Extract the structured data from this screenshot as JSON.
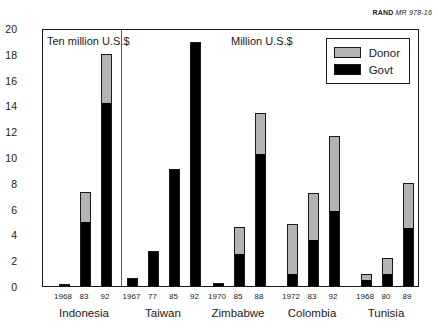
{
  "attribution": {
    "org": "RAND",
    "document_id": "MR 978-16"
  },
  "legend": {
    "items": [
      {
        "label": "Donor",
        "color": "#b3b3b3"
      },
      {
        "label": "Govt",
        "color": "#000000"
      }
    ]
  },
  "annotations": [
    {
      "text": "Ten million U.S.$",
      "applies_to": "Indonesia"
    },
    {
      "text": "Million U.S.$",
      "applies_to": "Taiwan, Zimbabwe, Colombia, Tunisia"
    }
  ],
  "chart_data": {
    "type": "bar",
    "title": "",
    "subtitle": "",
    "xlabel": "",
    "ylabel": "",
    "ylim": [
      0,
      20
    ],
    "yticks": [
      0,
      2,
      4,
      6,
      8,
      10,
      12,
      14,
      16,
      18,
      20
    ],
    "ytick_labels": [
      "0",
      "2",
      "4",
      "6",
      "8",
      "10",
      "12",
      "14",
      "16",
      "18",
      "20"
    ],
    "grid": false,
    "stacked": true,
    "legend_position": "top-right",
    "series": [
      {
        "name": "Govt",
        "color": "#000000"
      },
      {
        "name": "Donor",
        "color": "#b3b3b3"
      }
    ],
    "groups": [
      {
        "country": "Indonesia",
        "units": "Ten million U.S.$",
        "bars": [
          {
            "year": "1968",
            "govt": 0.1,
            "donor": 0.05,
            "total": 0.15
          },
          {
            "year": "83",
            "govt": 5.0,
            "donor": 2.3,
            "total": 7.3
          },
          {
            "year": "92",
            "govt": 14.2,
            "donor": 3.8,
            "total": 18.0
          }
        ]
      },
      {
        "country": "Taiwan",
        "units": "Million U.S.$",
        "bars": [
          {
            "year": "1967",
            "govt": 0.6,
            "donor": 0.0,
            "total": 0.6
          },
          {
            "year": "77",
            "govt": 2.7,
            "donor": 0.0,
            "total": 2.7
          },
          {
            "year": "85",
            "govt": 9.1,
            "donor": 0.0,
            "total": 9.1
          },
          {
            "year": "92",
            "govt": 18.9,
            "donor": 0.0,
            "total": 18.9
          }
        ]
      },
      {
        "country": "Zimbabwe",
        "units": "Million U.S.$",
        "bars": [
          {
            "year": "1970",
            "govt": 0.2,
            "donor": 0.0,
            "total": 0.2
          },
          {
            "year": "85",
            "govt": 2.5,
            "donor": 2.1,
            "total": 4.6
          },
          {
            "year": "88",
            "govt": 10.2,
            "donor": 3.2,
            "total": 13.4
          }
        ]
      },
      {
        "country": "Colombia",
        "units": "Million U.S.$",
        "bars": [
          {
            "year": "1972",
            "govt": 0.9,
            "donor": 3.9,
            "total": 4.8
          },
          {
            "year": "83",
            "govt": 3.6,
            "donor": 3.6,
            "total": 7.2
          },
          {
            "year": "92",
            "govt": 5.8,
            "donor": 5.8,
            "total": 11.6
          }
        ]
      },
      {
        "country": "Tunisia",
        "units": "Million U.S.$",
        "bars": [
          {
            "year": "1968",
            "govt": 0.5,
            "donor": 0.4,
            "total": 0.9
          },
          {
            "year": "80",
            "govt": 0.9,
            "donor": 1.3,
            "total": 2.2
          },
          {
            "year": "89",
            "govt": 4.5,
            "donor": 3.5,
            "total": 8.0
          }
        ]
      }
    ]
  },
  "layout": {
    "plot_left": 42,
    "plot_top": 29,
    "plot_width": 377,
    "plot_height": 258,
    "divider_x": 78,
    "group_centers": [
      42,
      121,
      196,
      270,
      344
    ],
    "group_span": 66,
    "bar_width": 11
  }
}
